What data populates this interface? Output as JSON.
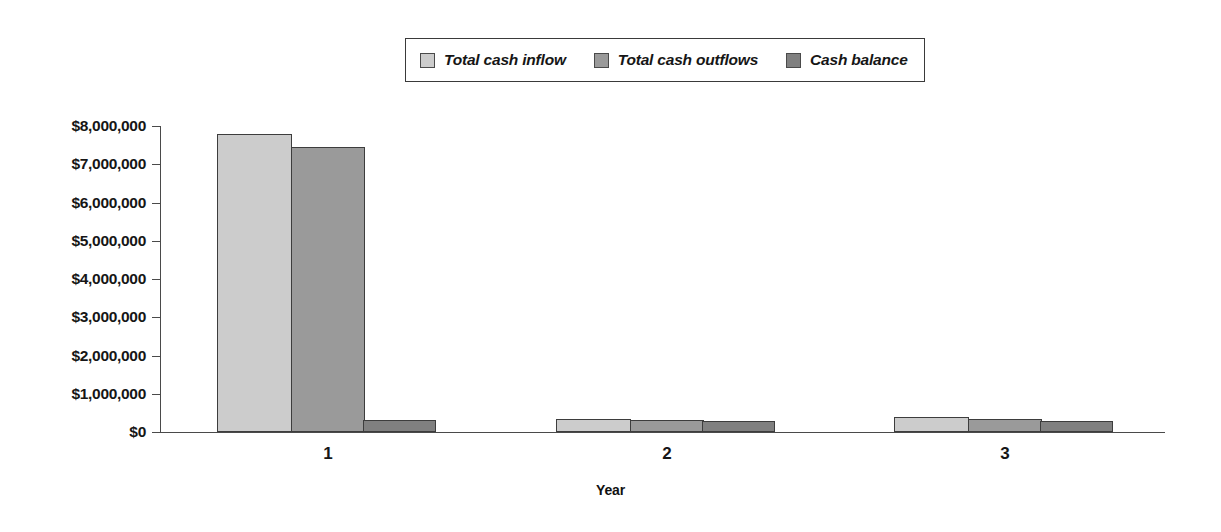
{
  "chart_data": {
    "type": "bar",
    "title": "",
    "subtitle": "",
    "xlabel": "Year",
    "ylabel": "",
    "categories": [
      "1",
      "2",
      "3"
    ],
    "series": [
      {
        "name": "Total cash inflow",
        "color": "#cccccc",
        "values": [
          7800000,
          330000,
          390000
        ]
      },
      {
        "name": "Total cash outflows",
        "color": "#9a9a9a",
        "values": [
          7450000,
          310000,
          350000
        ]
      },
      {
        "name": "Cash balance",
        "color": "#808080",
        "values": [
          310000,
          300000,
          300000
        ]
      }
    ],
    "ylim": [
      0,
      8000000
    ],
    "ytick_values": [
      0,
      1000000,
      2000000,
      3000000,
      4000000,
      5000000,
      6000000,
      7000000,
      8000000
    ],
    "ytick_labels": [
      "$0",
      "$1,000,000",
      "$2,000,000",
      "$3,000,000",
      "$4,000,000",
      "$5,000,000",
      "$6,000,000",
      "$7,000,000",
      "$8,000,000"
    ],
    "grid": false,
    "legend_position": "top-center",
    "legend_entries": [
      "Total cash inflow",
      "Total cash outflows",
      "Cash balance"
    ]
  },
  "legend": {
    "items": [
      {
        "label": "Total cash inflow",
        "color": "#cccccc"
      },
      {
        "label": "Total cash outflows",
        "color": "#9a9a9a"
      },
      {
        "label": "Cash balance",
        "color": "#808080"
      }
    ]
  },
  "axes": {
    "x_title": "Year",
    "x_categories": [
      "1",
      "2",
      "3"
    ],
    "y_labels": [
      "$8,000,000",
      "$7,000,000",
      "$6,000,000",
      "$5,000,000",
      "$4,000,000",
      "$3,000,000",
      "$2,000,000",
      "$1,000,000",
      "$0"
    ]
  }
}
